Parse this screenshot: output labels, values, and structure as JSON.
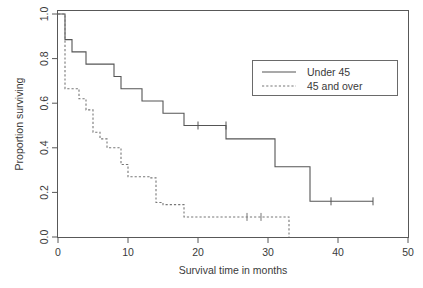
{
  "chart_data": {
    "type": "line",
    "title": "",
    "subtitle": "",
    "xlabel": "Survival time in months",
    "ylabel": "Proportion surviving",
    "xlim": [
      0,
      50
    ],
    "ylim": [
      0.0,
      1.0
    ],
    "xticks": [
      0,
      10,
      20,
      30,
      40,
      50
    ],
    "xtick_labels": [
      "0",
      "10",
      "20",
      "30",
      "40",
      "50"
    ],
    "yticks": [
      0.0,
      0.2,
      0.4,
      0.6,
      0.8,
      1.0
    ],
    "ytick_labels": [
      "0.0",
      "0.2",
      "0.4",
      "0.6",
      "0.8",
      "1.0"
    ],
    "grid": false,
    "legend_position": "upper right",
    "series": [
      {
        "name": "Under 45",
        "style": "solid",
        "color": "#555555",
        "points": [
          [
            0,
            1.0
          ],
          [
            1,
            1.0
          ],
          [
            1,
            0.885
          ],
          [
            2,
            0.885
          ],
          [
            2,
            0.83
          ],
          [
            4,
            0.83
          ],
          [
            4,
            0.775
          ],
          [
            8,
            0.775
          ],
          [
            8,
            0.72
          ],
          [
            9,
            0.72
          ],
          [
            9,
            0.665
          ],
          [
            12,
            0.665
          ],
          [
            12,
            0.61
          ],
          [
            15,
            0.61
          ],
          [
            15,
            0.555
          ],
          [
            18,
            0.555
          ],
          [
            18,
            0.5
          ],
          [
            24,
            0.5
          ],
          [
            24,
            0.44
          ],
          [
            31,
            0.44
          ],
          [
            31,
            0.315
          ],
          [
            36,
            0.315
          ],
          [
            36,
            0.16
          ],
          [
            45,
            0.16
          ]
        ],
        "censored": [
          [
            20,
            0.5
          ],
          [
            24,
            0.5
          ],
          [
            39,
            0.16
          ],
          [
            45,
            0.16
          ]
        ]
      },
      {
        "name": "45 and over",
        "style": "dashed",
        "color": "#777777",
        "points": [
          [
            0,
            1.0
          ],
          [
            1,
            1.0
          ],
          [
            1,
            0.665
          ],
          [
            3,
            0.665
          ],
          [
            3,
            0.62
          ],
          [
            4,
            0.62
          ],
          [
            4,
            0.57
          ],
          [
            5,
            0.57
          ],
          [
            5,
            0.47
          ],
          [
            6,
            0.47
          ],
          [
            6,
            0.44
          ],
          [
            7,
            0.44
          ],
          [
            7,
            0.4
          ],
          [
            9,
            0.4
          ],
          [
            9,
            0.325
          ],
          [
            10,
            0.325
          ],
          [
            10,
            0.27
          ],
          [
            13,
            0.27
          ],
          [
            13,
            0.265
          ],
          [
            14,
            0.265
          ],
          [
            14,
            0.155
          ],
          [
            15,
            0.155
          ],
          [
            15,
            0.145
          ],
          [
            18,
            0.145
          ],
          [
            18,
            0.09
          ],
          [
            33,
            0.09
          ],
          [
            33,
            0.0
          ]
        ],
        "censored": [
          [
            27,
            0.09
          ],
          [
            29,
            0.09
          ]
        ]
      }
    ]
  },
  "legend": {
    "entries": [
      {
        "label": "Under 45",
        "style": "solid"
      },
      {
        "label": "45 and over",
        "style": "dashed"
      }
    ]
  },
  "axes": {
    "x_title": "Survival time in months",
    "y_title": "Proportion surviving",
    "x_labels": [
      "0",
      "10",
      "20",
      "30",
      "40",
      "50"
    ],
    "y_labels": [
      "0.0",
      "0.2",
      "0.4",
      "0.6",
      "0.8",
      "1.0"
    ]
  }
}
